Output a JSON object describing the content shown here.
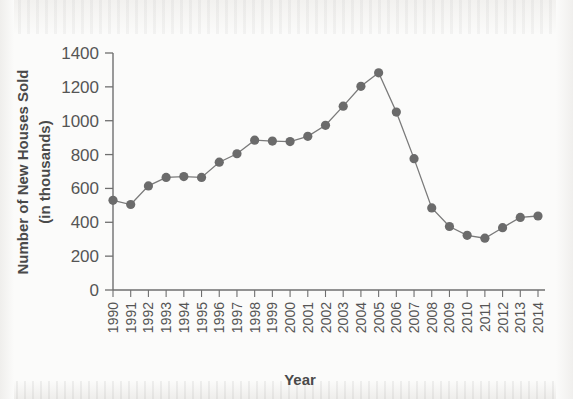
{
  "chart_data": {
    "type": "line",
    "title": "",
    "xlabel": "Year",
    "ylabel": "Number of New Houses Sold\n(in thousands)",
    "ylabel_line1": "Number of New Houses Sold",
    "ylabel_line2": "(in thousands)",
    "categories": [
      "1990",
      "1991",
      "1992",
      "1993",
      "1994",
      "1995",
      "1996",
      "1997",
      "1998",
      "1999",
      "2000",
      "2001",
      "2002",
      "2003",
      "2004",
      "2005",
      "2006",
      "2007",
      "2008",
      "2009",
      "2010",
      "2011",
      "2012",
      "2013",
      "2014"
    ],
    "values": [
      530,
      505,
      615,
      665,
      670,
      665,
      755,
      805,
      885,
      880,
      877,
      908,
      973,
      1086,
      1203,
      1283,
      1051,
      776,
      485,
      375,
      323,
      306,
      368,
      429,
      437
    ],
    "x": [
      1990,
      1991,
      1992,
      1993,
      1994,
      1995,
      1996,
      1997,
      1998,
      1999,
      2000,
      2001,
      2002,
      2003,
      2004,
      2005,
      2006,
      2007,
      2008,
      2009,
      2010,
      2011,
      2012,
      2013,
      2014
    ],
    "ylim": [
      0,
      1400
    ],
    "yticks": [
      0,
      200,
      400,
      600,
      800,
      1000,
      1200,
      1400
    ],
    "ytick_labels": [
      "0",
      "200",
      "400",
      "600",
      "800",
      "1000",
      "1200",
      "1400"
    ],
    "xtick_rotation": -90,
    "grid": false,
    "legend": null,
    "marker": "circle",
    "marker_color": "#6b6b6b",
    "line_color": "#7a7a7a",
    "axis_color": "#6f6f6f",
    "background_color": "#fbfbfa"
  }
}
